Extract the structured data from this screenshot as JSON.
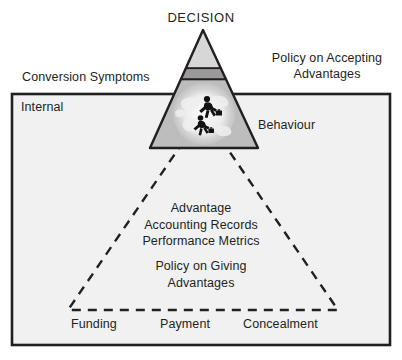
{
  "figure": {
    "title_top": "DECISION",
    "left_upper_label": "Conversion Symptoms",
    "right_upper_label": "Policy on Accepting\nAdvantages",
    "box_left_label": "Internal",
    "box_right_label": "Behaviour",
    "core_text": "Advantage\nAccounting Records\nPerformance Metrics",
    "policy_giving_text": "Policy on Giving\nAdvantages",
    "base_labels": [
      "Funding",
      "Payment",
      "Concealment"
    ],
    "icon_names": {
      "globe": "globe-icon",
      "runners": "running-businessmen-icon"
    },
    "colors": {
      "outline": "#231f20",
      "apex_fill": "#e2e2e2",
      "band_fill": "#9a9a9a",
      "mid_fill": "#b4b4b4",
      "box_fill": "#f1f1f1",
      "page_bg": "#ffffff",
      "text": "#231f20"
    }
  }
}
